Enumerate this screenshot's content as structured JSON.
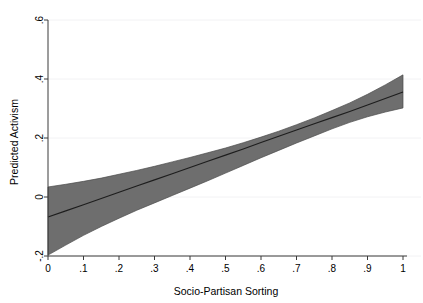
{
  "chart_data": {
    "type": "line",
    "title": "",
    "xlabel": "Socio-Partisan Sorting",
    "ylabel": "Predicted Activism",
    "xlim": [
      0,
      1
    ],
    "ylim": [
      -0.2,
      0.6
    ],
    "grid": true,
    "grid_axis": "y",
    "legend": "none",
    "x_ticks": [
      0,
      0.1,
      0.2,
      0.3,
      0.4,
      0.5,
      0.6,
      0.7,
      0.8,
      0.9,
      1
    ],
    "x_tick_labels": [
      "0",
      ".1",
      ".2",
      ".3",
      ".4",
      ".5",
      ".6",
      ".7",
      ".8",
      ".9",
      "1"
    ],
    "y_ticks": [
      -0.2,
      0,
      0.2,
      0.4,
      0.6
    ],
    "y_tick_labels": [
      "-.2",
      "0",
      ".2",
      ".4",
      ".6"
    ],
    "x": [
      0,
      0.05,
      0.1,
      0.15,
      0.2,
      0.25,
      0.3,
      0.35,
      0.4,
      0.45,
      0.5,
      0.55,
      0.6,
      0.65,
      0.7,
      0.75,
      0.8,
      0.85,
      0.9,
      0.95,
      1
    ],
    "series": [
      {
        "name": "Predicted Activism",
        "type": "line",
        "values": [
          -0.068,
          -0.047,
          -0.026,
          -0.005,
          0.016,
          0.037,
          0.058,
          0.079,
          0.1,
          0.121,
          0.142,
          0.163,
          0.185,
          0.206,
          0.227,
          0.248,
          0.269,
          0.29,
          0.312,
          0.334,
          0.356
        ]
      },
      {
        "name": "95% Confidence Interval Upper",
        "type": "band-upper",
        "values": [
          0.034,
          0.043,
          0.053,
          0.064,
          0.077,
          0.09,
          0.104,
          0.119,
          0.134,
          0.15,
          0.166,
          0.184,
          0.203,
          0.223,
          0.245,
          0.268,
          0.293,
          0.319,
          0.348,
          0.38,
          0.414
        ]
      },
      {
        "name": "95% Confidence Interval Lower",
        "type": "band-lower",
        "values": [
          -0.197,
          -0.163,
          -0.13,
          -0.1,
          -0.072,
          -0.045,
          -0.02,
          0.005,
          0.03,
          0.055,
          0.081,
          0.107,
          0.133,
          0.158,
          0.183,
          0.207,
          0.231,
          0.253,
          0.272,
          0.288,
          0.302
        ]
      }
    ],
    "colors": {
      "band_fill": "#6e6e6e",
      "band_edge": "#4a4a4a",
      "line": "#1d1d1d",
      "axis": "#3a3a3a",
      "grid": "#f2f2f4",
      "background": "#ffffff"
    }
  }
}
